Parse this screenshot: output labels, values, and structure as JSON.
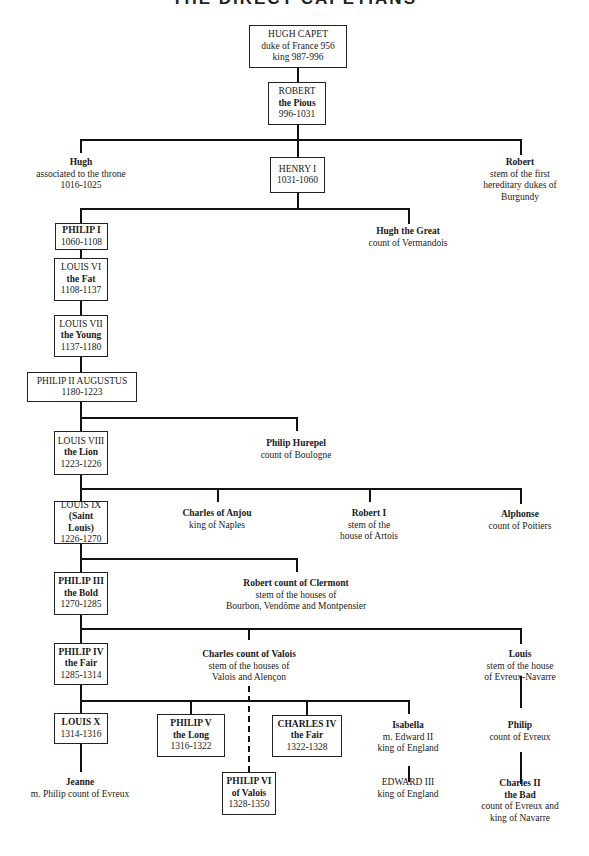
{
  "title": "THE DIRECT CAPETIANS",
  "persons": {
    "hugh_capet": {
      "name": "HUGH CAPET",
      "line1": "duke of France 956",
      "line2": "king 987-996"
    },
    "robert_pious": {
      "name": "ROBERT",
      "line1": "the Pious",
      "line2": "996-1031"
    },
    "hugh_assoc": {
      "name": "Hugh",
      "line1": "associated to the throne",
      "line2": "1016-1025"
    },
    "henry_i": {
      "name": "HENRY I",
      "line1": "1031-1060"
    },
    "robert_burgundy": {
      "name": "Robert",
      "line1": "stem of the first",
      "line2": "hereditary dukes of",
      "line3": "Burgundy"
    },
    "philip_i": {
      "name": "PHILIP I",
      "line1": "1060-1108"
    },
    "hugh_great": {
      "name": "Hugh the Great",
      "line1": "count of Vermandois"
    },
    "louis_vi": {
      "name": "LOUIS VI",
      "line1": "the Fat",
      "line2": "1108-1137"
    },
    "louis_vii": {
      "name": "LOUIS VII",
      "line1": "the Young",
      "line2": "1137-1180"
    },
    "philip_ii": {
      "name": "PHILIP II AUGUSTUS",
      "line1": "1180-1223"
    },
    "louis_viii": {
      "name": "LOUIS VIII",
      "line1": "the Lion",
      "line2": "1223-1226"
    },
    "philip_hurepel": {
      "name": "Philip Hurepel",
      "line1": "count of Boulogne"
    },
    "louis_ix": {
      "name": "LOUIS IX",
      "line1": "(Saint Louis)",
      "line2": "1226-1270"
    },
    "charles_anjou": {
      "name": "Charles of Anjou",
      "line1": "king of Naples"
    },
    "robert_i": {
      "name": "Robert I",
      "line1": "stem of the",
      "line2": "house of Artois"
    },
    "alphonse": {
      "name": "Alphonse",
      "line1": "count of Poitiers"
    },
    "philip_iii": {
      "name": "PHILIP III",
      "line1": "the Bold",
      "line2": "1270-1285"
    },
    "robert_clermont": {
      "name": "Robert count of Clermont",
      "line1": "stem of the houses of",
      "line2": "Bourbon, Vendôme and Montpensier"
    },
    "philip_iv": {
      "name": "PHILIP IV",
      "line1": "the Fair",
      "line2": "1285-1314"
    },
    "charles_valois": {
      "name": "Charles count of Valois",
      "line1": "stem of the houses of",
      "line2": "Valois and Alençon"
    },
    "louis_evreux": {
      "name": "Louis",
      "line1": "stem of the house",
      "line2": "of Evreux-Navarre"
    },
    "louis_x": {
      "name": "LOUIS X",
      "line1": "1314-1316"
    },
    "philip_v": {
      "name": "PHILIP V",
      "line1": "the Long",
      "line2": "1316-1322"
    },
    "charles_iv": {
      "name": "CHARLES IV",
      "line1": "the Fair",
      "line2": "1322-1328"
    },
    "isabella": {
      "name": "Isabella",
      "line1": "m. Edward II",
      "line2": "king of England"
    },
    "philip_evreux": {
      "name": "Philip",
      "line1": "count of Evreux"
    },
    "jeanne": {
      "name": "Jeanne",
      "line1": "m. Philip count of Evreux"
    },
    "philip_vi": {
      "name": "PHILIP VI",
      "line1": "of Valois",
      "line2": "1328-1350"
    },
    "edward_iii": {
      "name": "EDWARD III",
      "line1": "king of England"
    },
    "charles_ii": {
      "name": "Charles II",
      "line1": "the Bad",
      "line2": "count of Evreux and",
      "line3": "king of Navarre"
    }
  }
}
